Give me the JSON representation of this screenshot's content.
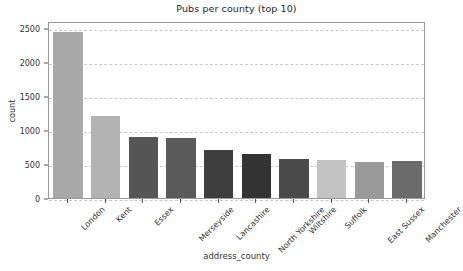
{
  "chart_data": {
    "type": "bar",
    "title": "Pubs per county (top 10)",
    "xlabel": "address_county",
    "ylabel": "count",
    "categories": [
      "London",
      "Kent",
      "Essex",
      "Merseyside",
      "Lancashire",
      "North Yorkshire",
      "Wiltshire",
      "Suffolk",
      "East Sussex",
      "Manchester"
    ],
    "values": [
      2440,
      1205,
      890,
      880,
      705,
      650,
      575,
      555,
      530,
      540
    ],
    "colors": [
      "#a9a9a9",
      "#b3b3b3",
      "#565656",
      "#5a5a5a",
      "#3e3e3e",
      "#333333",
      "#4a4a4a",
      "#c2c2c2",
      "#9a9a9a",
      "#6b6b6b"
    ],
    "ylim": [
      0,
      2600
    ],
    "yticks": [
      0,
      500,
      1000,
      1500,
      2000,
      2500
    ],
    "ytick_labels": [
      "0",
      "500",
      "1000",
      "1500",
      "2000",
      "2500"
    ],
    "grid": true,
    "grid_axis": "y",
    "legend": "none"
  },
  "figure": {
    "background_color": "#ffffff",
    "axes_edge_color": "#999999",
    "grid_color": "#c9c9d4",
    "tick_color": "#555555",
    "text_color": "#333333"
  }
}
